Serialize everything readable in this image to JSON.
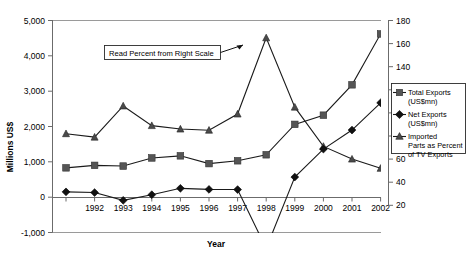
{
  "chart_data": {
    "type": "line",
    "title": "",
    "xlabel": "Year",
    "ylabel": "Millions US$",
    "y2label": "",
    "ylim": [
      -1000,
      5000
    ],
    "y2lim": [
      20,
      180
    ],
    "grid": false,
    "legend_position": "right",
    "categories": [
      "1991",
      "1992",
      "1993",
      "1994",
      "1995",
      "1996",
      "1997",
      "1998",
      "1999",
      "2000",
      "2001",
      "2002"
    ],
    "x_tick_labels": [
      "",
      "1992",
      "1993",
      "1994",
      "1995",
      "1996",
      "1997",
      "1998",
      "1999",
      "2000",
      "2001",
      "2002"
    ],
    "y_tick_labels": [
      "5,000",
      "4,000",
      "3,000",
      "2,000",
      "1,000",
      "0",
      "-1,000"
    ],
    "y_tick_values": [
      5000,
      4000,
      3000,
      2000,
      1000,
      0,
      -1000
    ],
    "y2_tick_labels": [
      "180",
      "160",
      "140",
      "120",
      "100",
      "80",
      "60",
      "40",
      "20"
    ],
    "y2_tick_values": [
      180,
      160,
      140,
      120,
      100,
      80,
      60,
      40,
      20
    ],
    "series": [
      {
        "name": "Total Exports (US$mn)",
        "axis": "left",
        "marker": "square",
        "color": "#555555",
        "values": [
          830,
          900,
          880,
          1110,
          1170,
          950,
          1030,
          1200,
          2060,
          2320,
          3180,
          4620
        ]
      },
      {
        "name": "Net Exports (US$mn)",
        "axis": "left",
        "marker": "diamond",
        "color": "#111111",
        "values": [
          150,
          130,
          -90,
          70,
          250,
          220,
          215,
          -1450,
          570,
          1360,
          1900,
          2670
        ]
      },
      {
        "name": "Imported Parts as Percent of TV Exports",
        "axis": "right",
        "marker": "triangle",
        "color": "#4a4a4a",
        "values": [
          82,
          79,
          106,
          89,
          86,
          85,
          99,
          165,
          105,
          71,
          60,
          52
        ]
      }
    ],
    "annotations": [
      {
        "text": "Read Percent from Right Scale",
        "points_to_year": "1998",
        "points_to_series": "Imported Parts as Percent of TV Exports"
      }
    ]
  },
  "legend": {
    "items": [
      {
        "label_line1": "Total Exports",
        "label_line2": "(US$mn)",
        "marker": "square"
      },
      {
        "label_line1": "Net Exports",
        "label_line2": "(US$mn)",
        "marker": "diamond"
      },
      {
        "label_line1": "Imported",
        "label_line2": "Parts as Percent",
        "label_line3": "of TV Exports",
        "marker": "triangle"
      }
    ]
  }
}
